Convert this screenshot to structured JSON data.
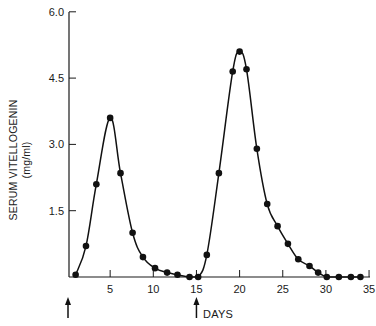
{
  "chart_data": {
    "type": "line",
    "title": "",
    "xlabel": "DAYS",
    "ylabel": "SERUM VITELLOGENIN",
    "ylabel_unit": "(mg/ml)",
    "xlim": [
      0,
      35
    ],
    "ylim": [
      0,
      6.0
    ],
    "x_ticks": [
      5,
      10,
      15,
      20,
      25,
      30,
      35
    ],
    "x_tick_labels": [
      "5",
      "10",
      "15",
      "20",
      "25",
      "30",
      "35"
    ],
    "y_ticks": [
      1.5,
      3.0,
      4.5,
      6.0
    ],
    "y_tick_labels": [
      "1.5",
      "3.0",
      "4.5",
      "6.0"
    ],
    "grid": false,
    "legend": null,
    "series": [
      {
        "name": "Serum vitellogenin",
        "style": "smooth line with filled circle markers",
        "x": [
          1.0,
          2.2,
          3.4,
          5.0,
          6.2,
          7.6,
          8.8,
          10.2,
          11.6,
          12.8,
          14.2,
          15.2,
          16.2,
          17.6,
          19.2,
          20.0,
          20.8,
          22.0,
          23.2,
          24.4,
          25.6,
          26.8,
          28.1,
          29.1,
          30.1,
          31.5,
          32.9,
          34.0
        ],
        "y": [
          0.05,
          0.7,
          2.1,
          3.6,
          2.35,
          1.0,
          0.45,
          0.2,
          0.1,
          0.05,
          0.0,
          0.0,
          0.5,
          2.35,
          4.65,
          5.1,
          4.7,
          2.9,
          1.65,
          1.15,
          0.75,
          0.4,
          0.25,
          0.1,
          0.0,
          0.0,
          0.0,
          0.0
        ]
      }
    ],
    "annotations": [
      {
        "type": "arrow",
        "direction": "up",
        "x": 0,
        "position": "below x-axis"
      },
      {
        "type": "arrow",
        "direction": "up",
        "x": 15,
        "position": "below x-axis"
      }
    ]
  },
  "labels": {
    "ylabel": "SERUM VITELLOGENIN",
    "yunit": "(mg/ml)",
    "xlabel": "DAYS"
  }
}
